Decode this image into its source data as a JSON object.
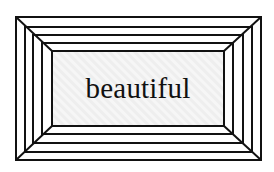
{
  "illustration": {
    "word": "beautiful",
    "colors": {
      "background": "#ffffff",
      "inner_panel": "#efefef",
      "stripe": "#f7f7f7",
      "lines": "#111111"
    },
    "frames": [
      {
        "x1": 16,
        "y1": 17,
        "x2": 261,
        "y2": 160
      },
      {
        "x1": 25,
        "y1": 27,
        "x2": 252,
        "y2": 152
      },
      {
        "x1": 33,
        "y1": 35,
        "x2": 243,
        "y2": 143
      },
      {
        "x1": 42,
        "y1": 43,
        "x2": 233,
        "y2": 134
      },
      {
        "x1": 52,
        "y1": 51,
        "x2": 224,
        "y2": 126
      }
    ]
  }
}
